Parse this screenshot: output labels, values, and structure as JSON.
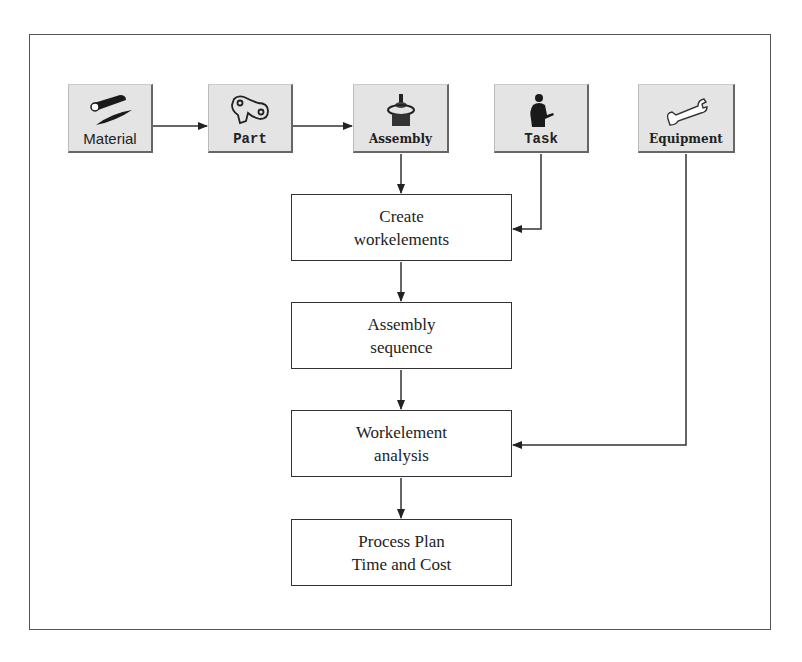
{
  "diagram": {
    "inputs": [
      {
        "id": "material",
        "label": "Material",
        "icon": "material-bar-icon"
      },
      {
        "id": "part",
        "label": "Part",
        "icon": "part-icon"
      },
      {
        "id": "assembly",
        "label": "Assembly",
        "icon": "assembly-icon"
      },
      {
        "id": "task",
        "label": "Task",
        "icon": "worker-icon"
      },
      {
        "id": "equipment",
        "label": "Equipment",
        "icon": "wrench-icon"
      }
    ],
    "steps": [
      {
        "id": "create",
        "line1": "Create",
        "line2": "workelements"
      },
      {
        "id": "sequence",
        "line1": "Assembly",
        "line2": "sequence"
      },
      {
        "id": "analysis",
        "line1": "Workelement",
        "line2": "analysis"
      },
      {
        "id": "plan",
        "line1": "Process Plan",
        "line2": "Time and Cost"
      }
    ],
    "edges": [
      {
        "from": "material",
        "to": "part"
      },
      {
        "from": "part",
        "to": "assembly"
      },
      {
        "from": "assembly",
        "to": "create"
      },
      {
        "from": "task",
        "to": "create"
      },
      {
        "from": "create",
        "to": "sequence"
      },
      {
        "from": "sequence",
        "to": "analysis"
      },
      {
        "from": "equipment",
        "to": "analysis"
      },
      {
        "from": "analysis",
        "to": "plan"
      }
    ],
    "colors": {
      "line": "#333333",
      "button_bg": "#e4e4e4",
      "frame": "#555555"
    }
  }
}
